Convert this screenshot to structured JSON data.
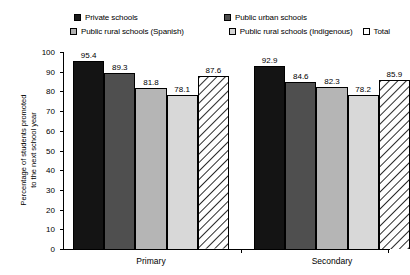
{
  "chart_data": {
    "type": "bar",
    "title": "",
    "xlabel": "",
    "ylabel": "Percentage of students promoted to the next school year",
    "ylabel_line1": "Percentage of students promoted",
    "ylabel_line2": "to the next school year",
    "ylim": [
      0,
      100
    ],
    "ytick_step": 10,
    "yticks": [
      100,
      90,
      80,
      70,
      60,
      50,
      40,
      30,
      20,
      10,
      0
    ],
    "ytick_labels": [
      "100",
      "90",
      "80",
      "70",
      "60",
      "50",
      "40",
      "30",
      "20",
      "10",
      "0"
    ],
    "grid": false,
    "legend_position": "top",
    "categories": [
      "Primary",
      "Secondary"
    ],
    "series": [
      {
        "name": "Private schools",
        "swatch": "solid-black",
        "color": "#141414",
        "values": [
          95.4,
          89.3
        ],
        "labels": [
          "95.4",
          "89.3"
        ]
      },
      {
        "name": "Public urban schools",
        "swatch": "solid-dark-gray",
        "color": "#4f4f4f",
        "values": [
          89.3,
          84.6
        ],
        "labels": [
          "89.3",
          "84.6"
        ]
      },
      {
        "name": "Public rural schools (Spanish)",
        "swatch": "solid-medium-gray",
        "color": "#b5b5b5",
        "values": [
          81.8,
          82.3
        ],
        "labels": [
          "81.8",
          "82.3"
        ]
      },
      {
        "name": "Public rural schools (Indigenous)",
        "swatch": "solid-light-gray",
        "color": "#d8d8d8",
        "values": [
          78.1,
          78.2
        ],
        "labels": [
          "78.1",
          "78.2"
        ]
      },
      {
        "name": "Total",
        "swatch": "diagonal-hatch",
        "color": "#ffffff",
        "values": [
          87.6,
          85.9
        ],
        "labels": [
          "87.6",
          "85.9"
        ]
      }
    ],
    "groups": [
      {
        "label": "Primary",
        "bars": [
          {
            "series": "Private schools",
            "value": 95.4,
            "label": "95.4"
          },
          {
            "series": "Public urban schools",
            "value": 89.3,
            "label": "89.3"
          },
          {
            "series": "Public rural schools (Spanish)",
            "value": 81.8,
            "label": "81.8"
          },
          {
            "series": "Public rural schools (Indigenous)",
            "value": 78.1,
            "label": "78.1"
          },
          {
            "series": "Total",
            "value": 87.6,
            "label": "87.6"
          }
        ]
      },
      {
        "label": "Secondary",
        "bars": [
          {
            "series": "Private schools",
            "value": 92.9,
            "label": "92.9"
          },
          {
            "series": "Public urban schools",
            "value": 84.6,
            "label": "84.6"
          },
          {
            "series": "Public rural schools (Spanish)",
            "value": 82.3,
            "label": "82.3"
          },
          {
            "series": "Public rural schools (Indigenous)",
            "value": 78.2,
            "label": "78.2"
          },
          {
            "series": "Total",
            "value": 85.9,
            "label": "85.9"
          }
        ]
      }
    ]
  },
  "legend": {
    "items": [
      {
        "label": "Private schools"
      },
      {
        "label": "Public urban schools"
      },
      {
        "label": "Public rural schools (Spanish)"
      },
      {
        "label": "Public rural schools (Indigenous)"
      },
      {
        "label": "Total"
      }
    ]
  },
  "axis": {
    "y_title_line1": "Percentage of students promoted",
    "y_title_line2": "to the next school year",
    "y_labels": [
      "100",
      "90",
      "80",
      "70",
      "60",
      "50",
      "40",
      "30",
      "20",
      "10",
      "0"
    ],
    "x_labels": [
      "Primary",
      "Secondary"
    ]
  }
}
